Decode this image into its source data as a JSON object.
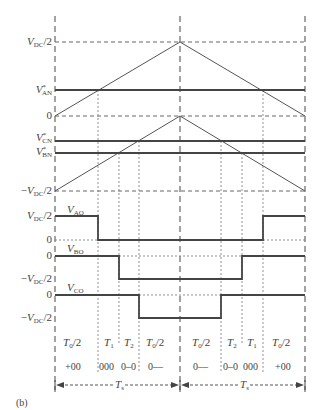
{
  "figure": {
    "panel_label": "(b)",
    "y_labels": {
      "vdc_half_top": "V_DC/2",
      "v_an_ref": "V*AN",
      "zero_top": "0",
      "v_cn_ref": "V*CN",
      "v_bn_ref": "V*BN",
      "neg_vdc_half_top": "−V_DC/2",
      "vdc_half_ao": "V_DC/2",
      "zero_ao": "0",
      "zero_bo": "0",
      "neg_vdc_half_bo": "−V_DC/2",
      "zero_co": "0",
      "neg_vdc_half_co": "−V_DC/2"
    },
    "signal_labels": {
      "v_ao": "V_AO",
      "v_bo": "V_BO",
      "v_co": "V_CO"
    },
    "intervals": [
      {
        "label": "T0/2",
        "code": "+00"
      },
      {
        "label": "T1",
        "code": "000"
      },
      {
        "label": "T2",
        "code": "0–0"
      },
      {
        "label": "T0/2",
        "code": "0––"
      },
      {
        "label": "T0/2",
        "code": "0––"
      },
      {
        "label": "T2",
        "code": "0–0"
      },
      {
        "label": "T1",
        "code": "000"
      },
      {
        "label": "T0/2",
        "code": "+00"
      }
    ],
    "period_labels": [
      "Ts",
      "Ts"
    ]
  },
  "colors": {
    "line": "#555555",
    "signal": "#444444",
    "dashed": "#666666"
  }
}
